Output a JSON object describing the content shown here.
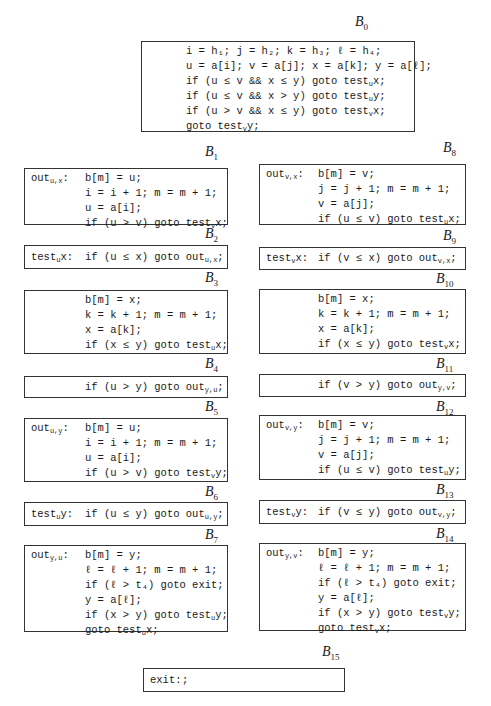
{
  "blocks": [
    {
      "id": "B0",
      "label": "B",
      "sub": "0",
      "lines": [
        "i = h₁; j = h₂; k = h₃; ℓ = h₄;",
        "u = a[i]; v = a[j]; x = a[k]; y = a[ℓ];",
        "if (u ≤ v && x ≤ y) goto test_ux;",
        "if (u ≤ v && x > y) goto test_uy;",
        "if (u > v && x ≤ y) goto test_vx;",
        "goto test_vy;"
      ]
    },
    {
      "id": "B1",
      "label": "B",
      "sub": "1",
      "prefix": "out_u,x:",
      "lines": [
        "b[m] = u;",
        "i = i + 1; m = m + 1;",
        "u = a[i];",
        "if (u > v) goto test_vx;"
      ]
    },
    {
      "id": "B2",
      "label": "B",
      "sub": "2",
      "prefix": "test_ux:",
      "lines": [
        "if (u ≤ x) goto out_u,x;"
      ]
    },
    {
      "id": "B3",
      "label": "B",
      "sub": "3",
      "lines": [
        "b[m] = x;",
        "k = k + 1; m = m + 1;",
        "x = a[k];",
        "if (x ≤ y) goto test_ux;"
      ]
    },
    {
      "id": "B4",
      "label": "B",
      "sub": "4",
      "lines": [
        "if (u > y) goto out_y,u;"
      ]
    },
    {
      "id": "B5",
      "label": "B",
      "sub": "5",
      "prefix": "out_u,y:",
      "lines": [
        "b[m] = u;",
        "i = i + 1; m = m + 1;",
        "u = a[i];",
        "if (u > v) goto test_vy;"
      ]
    },
    {
      "id": "B6",
      "label": "B",
      "sub": "6",
      "prefix": "test_uy:",
      "lines": [
        "if (u ≤ y) goto out_u,y;"
      ]
    },
    {
      "id": "B7",
      "label": "B",
      "sub": "7",
      "prefix": "out_y,u:",
      "lines": [
        "b[m] = y;",
        "ℓ = ℓ + 1; m = m + 1;",
        "if (ℓ > t₄) goto exit;",
        "y = a[ℓ];",
        "if (x > y) goto test_uy;",
        "goto test_ux;"
      ]
    },
    {
      "id": "B8",
      "label": "B",
      "sub": "8",
      "prefix": "out_v,x:",
      "lines": [
        "b[m] = v;",
        "j = j + 1; m = m + 1;",
        "v = a[j];",
        "if (u ≤ v) goto test_ux;"
      ]
    },
    {
      "id": "B9",
      "label": "B",
      "sub": "9",
      "prefix": "test_vx:",
      "lines": [
        "if (v ≤ x) goto out_v,x;"
      ]
    },
    {
      "id": "B10",
      "label": "B",
      "sub": "10",
      "lines": [
        "b[m] = x;",
        "k = k + 1; m = m + 1;",
        "x = a[k];",
        "if (x ≤ y) goto test_vx;"
      ]
    },
    {
      "id": "B11",
      "label": "B",
      "sub": "11",
      "lines": [
        "if (v > y) goto out_y,v;"
      ]
    },
    {
      "id": "B12",
      "label": "B",
      "sub": "12",
      "prefix": "out_v,y:",
      "lines": [
        "b[m] = v;",
        "j = j + 1; m = m + 1;",
        "v = a[j];",
        "if (u ≤ v) goto test_uy;"
      ]
    },
    {
      "id": "B13",
      "label": "B",
      "sub": "13",
      "prefix": "test_vy:",
      "lines": [
        "if (v ≤ y) goto out_v,y;"
      ]
    },
    {
      "id": "B14",
      "label": "B",
      "sub": "14",
      "prefix": "out_y,v:",
      "lines": [
        "b[m] = y;",
        "ℓ = ℓ + 1; m = m + 1;",
        "if (ℓ > t₄) goto exit;",
        "y = a[ℓ];",
        "if (x > y) goto test_vy;",
        "goto test_vx;"
      ]
    },
    {
      "id": "B15",
      "label": "B",
      "sub": "15",
      "prefix": "exit:",
      "lines": [
        ";"
      ]
    }
  ]
}
